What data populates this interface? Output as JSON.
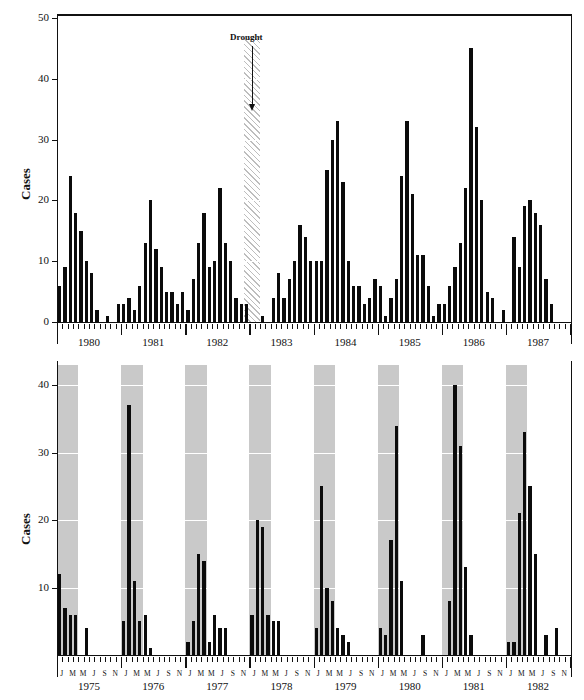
{
  "figure": {
    "ylabel": "Cases",
    "month_ticklabels": [
      "J",
      "M",
      "M",
      "J",
      "S",
      "N"
    ],
    "colors": {
      "bar": "#0b0b0b",
      "band": "#c9c9c9",
      "gridline": "#ffffff",
      "axis": "#111111"
    }
  },
  "chart_data": [
    {
      "id": "melbourne",
      "type": "bar",
      "title": "Melbourne",
      "xlabel": "",
      "ylabel": "Cases",
      "ylim": [
        0,
        50
      ],
      "yticks": [
        0,
        10,
        20,
        30,
        40,
        50
      ],
      "grid": true,
      "legend": "none",
      "years": [
        1980,
        1981,
        1982,
        1983,
        1984,
        1985,
        1986,
        1987
      ],
      "x": [
        "1980-J",
        "1980-F",
        "1980-M",
        "1980-A",
        "1980-M",
        "1980-J",
        "1980-J",
        "1980-A",
        "1980-S",
        "1980-O",
        "1980-N",
        "1980-D",
        "1981-J",
        "1981-F",
        "1981-M",
        "1981-A",
        "1981-M",
        "1981-J",
        "1981-J",
        "1981-A",
        "1981-S",
        "1981-O",
        "1981-N",
        "1981-D",
        "1982-J",
        "1982-F",
        "1982-M",
        "1982-A",
        "1982-M",
        "1982-J",
        "1982-J",
        "1982-A",
        "1982-S",
        "1982-O",
        "1982-N",
        "1982-D",
        "1983-J",
        "1983-F",
        "1983-M",
        "1983-A",
        "1983-M",
        "1983-J",
        "1983-J",
        "1983-A",
        "1983-S",
        "1983-O",
        "1983-N",
        "1983-D",
        "1984-J",
        "1984-F",
        "1984-M",
        "1984-A",
        "1984-M",
        "1984-J",
        "1984-J",
        "1984-A",
        "1984-S",
        "1984-O",
        "1984-N",
        "1984-D",
        "1985-J",
        "1985-F",
        "1985-M",
        "1985-A",
        "1985-M",
        "1985-J",
        "1985-J",
        "1985-A",
        "1985-S",
        "1985-O",
        "1985-N",
        "1985-D",
        "1986-J",
        "1986-F",
        "1986-M",
        "1986-A",
        "1986-M",
        "1986-J",
        "1986-J",
        "1986-A",
        "1986-S",
        "1986-O",
        "1986-N",
        "1986-D",
        "1987-J",
        "1987-F",
        "1987-M",
        "1987-A",
        "1987-M",
        "1987-J",
        "1987-J",
        "1987-A",
        "1987-S",
        "1987-O",
        "1987-N",
        "1987-D"
      ],
      "values": [
        6,
        9,
        24,
        18,
        15,
        10,
        8,
        2,
        0,
        1,
        0,
        3,
        3,
        4,
        2,
        6,
        13,
        20,
        12,
        9,
        5,
        5,
        3,
        5,
        2,
        7,
        13,
        18,
        9,
        10,
        22,
        13,
        10,
        4,
        3,
        3,
        0,
        0,
        1,
        0,
        4,
        8,
        4,
        7,
        10,
        16,
        14,
        10,
        10,
        10,
        25,
        30,
        33,
        23,
        10,
        6,
        6,
        3,
        4,
        7,
        6,
        1,
        4,
        7,
        24,
        33,
        21,
        11,
        11,
        6,
        1,
        3,
        3,
        6,
        9,
        13,
        22,
        45,
        32,
        20,
        5,
        4,
        0,
        2,
        0,
        14,
        9,
        19,
        20,
        18,
        16,
        7,
        3,
        0,
        0,
        0
      ],
      "annotations": [
        {
          "text": "Drought",
          "kind": "hatched-band-with-arrow",
          "span": [
            "1982-D",
            "1983-F"
          ]
        }
      ],
      "shaded_bands": {
        "label": "seasonal shading",
        "spans": [
          [
            "1980-F",
            "1980-J"
          ],
          [
            "1981-F",
            "1981-J"
          ],
          [
            "1982-F",
            "1982-J"
          ],
          [
            "1984-F",
            "1984-J"
          ],
          [
            "1985-F",
            "1985-J"
          ],
          [
            "1986-F",
            "1986-J"
          ],
          [
            "1987-F",
            "1987-J"
          ]
        ]
      }
    },
    {
      "id": "washington-dc",
      "type": "bar",
      "title": "Washington, D. C.",
      "xlabel": "",
      "ylabel": "Cases",
      "ylim": [
        0,
        43
      ],
      "yticks": [
        10,
        20,
        30,
        40
      ],
      "grid": true,
      "legend": "none",
      "years": [
        1975,
        1976,
        1977,
        1978,
        1979,
        1980,
        1981,
        1982
      ],
      "x": [
        "1975-J",
        "1975-F",
        "1975-M",
        "1975-A",
        "1975-M",
        "1975-J",
        "1975-J",
        "1975-A",
        "1975-S",
        "1975-O",
        "1975-N",
        "1975-D",
        "1976-J",
        "1976-F",
        "1976-M",
        "1976-A",
        "1976-M",
        "1976-J",
        "1976-J",
        "1976-A",
        "1976-S",
        "1976-O",
        "1976-N",
        "1976-D",
        "1977-J",
        "1977-F",
        "1977-M",
        "1977-A",
        "1977-M",
        "1977-J",
        "1977-J",
        "1977-A",
        "1977-S",
        "1977-O",
        "1977-N",
        "1977-D",
        "1978-J",
        "1978-F",
        "1978-M",
        "1978-A",
        "1978-M",
        "1978-J",
        "1978-J",
        "1978-A",
        "1978-S",
        "1978-O",
        "1978-N",
        "1978-D",
        "1979-J",
        "1979-F",
        "1979-M",
        "1979-A",
        "1979-M",
        "1979-J",
        "1979-J",
        "1979-A",
        "1979-S",
        "1979-O",
        "1979-N",
        "1979-D",
        "1980-J",
        "1980-F",
        "1980-M",
        "1980-A",
        "1980-M",
        "1980-J",
        "1980-J",
        "1980-A",
        "1980-S",
        "1980-O",
        "1980-N",
        "1980-D",
        "1981-J",
        "1981-F",
        "1981-M",
        "1981-A",
        "1981-M",
        "1981-J",
        "1981-J",
        "1981-A",
        "1981-S",
        "1981-O",
        "1981-N",
        "1981-D",
        "1982-J",
        "1982-F",
        "1982-M",
        "1982-A",
        "1982-M",
        "1982-J",
        "1982-J",
        "1982-A",
        "1982-S",
        "1982-O",
        "1982-N",
        "1982-D"
      ],
      "values": [
        12,
        7,
        6,
        6,
        0,
        4,
        0,
        0,
        0,
        0,
        0,
        0,
        5,
        37,
        11,
        5,
        6,
        1,
        0,
        0,
        0,
        0,
        0,
        0,
        2,
        5,
        15,
        14,
        2,
        6,
        4,
        4,
        0,
        0,
        0,
        0,
        6,
        20,
        19,
        6,
        5,
        5,
        0,
        0,
        0,
        0,
        0,
        0,
        4,
        25,
        10,
        8,
        4,
        3,
        2,
        0,
        0,
        0,
        0,
        0,
        4,
        3,
        17,
        34,
        11,
        0,
        0,
        0,
        3,
        0,
        0,
        0,
        0,
        8,
        40,
        31,
        13,
        3,
        0,
        0,
        0,
        0,
        0,
        0,
        2,
        2,
        21,
        33,
        25,
        15,
        0,
        3,
        0,
        4,
        0,
        0
      ],
      "shaded_bands": {
        "label": "seasonal shading",
        "spans": [
          [
            "1975-J",
            "1975-A"
          ],
          [
            "1976-J",
            "1976-A"
          ],
          [
            "1977-J",
            "1977-A"
          ],
          [
            "1978-J",
            "1978-A"
          ],
          [
            "1979-J",
            "1979-A"
          ],
          [
            "1980-J",
            "1980-A"
          ],
          [
            "1981-J",
            "1981-A"
          ],
          [
            "1982-J",
            "1982-A"
          ]
        ]
      }
    }
  ]
}
